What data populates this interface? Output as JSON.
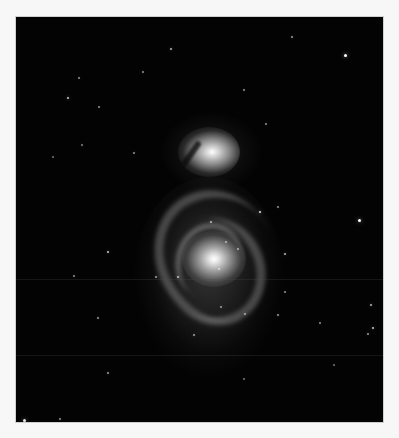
{
  "image": {
    "subject": "Whirlpool Galaxy (M51) with companion galaxy",
    "colors": {
      "background": "#f7f7f7",
      "sky": "#030303",
      "core": "#ffffff"
    }
  }
}
